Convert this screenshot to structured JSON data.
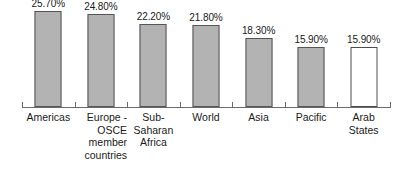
{
  "chart_data": {
    "type": "bar",
    "title": "",
    "subtitle": "",
    "xlabel": "",
    "ylabel": "",
    "ylim": [
      0,
      28.5
    ],
    "grid": false,
    "legend": "none",
    "value_format": "percent-2dp",
    "categories": [
      "Americas",
      "Europe -\nOSCE\nmember\ncountries",
      "Sub-\nSaharan\nAfrica",
      "World",
      "Asia",
      "Pacific",
      "Arab States"
    ],
    "values": [
      25.7,
      24.8,
      22.2,
      21.8,
      18.3,
      15.9,
      15.9
    ],
    "value_labels": [
      "25.70%",
      "24.80%",
      "22.20%",
      "21.80%",
      "18.30%",
      "15.90%",
      "15.90%"
    ],
    "bar_styles": [
      "filled",
      "filled",
      "filled",
      "filled",
      "filled",
      "filled",
      "open"
    ],
    "label_align": [
      "center",
      "right",
      "center",
      "center",
      "center",
      "center",
      "center"
    ]
  },
  "colors": {
    "bar_fill": "#b3b3b3",
    "bar_border": "#555555",
    "open_bar_fill": "#ffffff",
    "open_bar_border": "#4d4d4d",
    "axis": "#6b6b6b",
    "text": "#1a1a1a",
    "background": "#ffffff"
  }
}
